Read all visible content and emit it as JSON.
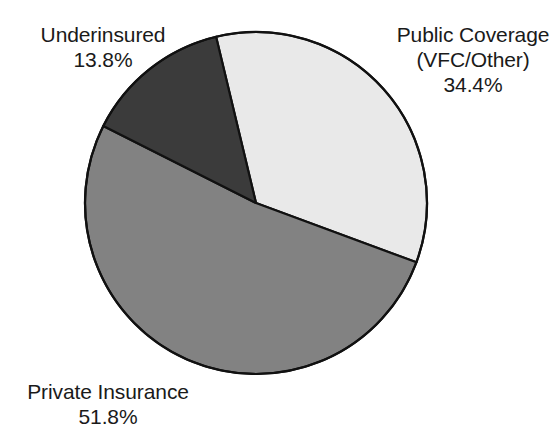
{
  "chart_data": {
    "type": "pie",
    "title": "",
    "categories": [
      "Public Coverage (VFC/Other)",
      "Private Insurance",
      "Underinsured"
    ],
    "values": [
      34.4,
      51.8,
      13.8
    ],
    "value_suffix": "%",
    "legend": "none",
    "grid": false,
    "slices": [
      {
        "label": "Public Coverage",
        "label_line2": "(VFC/Other)",
        "percent_text": "34.4%",
        "value": 34.4,
        "color": "#e9e9e9",
        "start_angle_deg": -13.5,
        "end_angle_deg": 110.3
      },
      {
        "label": "Private Insurance",
        "label_line2": "",
        "percent_text": "51.8%",
        "value": 51.8,
        "color": "#828282",
        "start_angle_deg": 110.3,
        "end_angle_deg": 296.8
      },
      {
        "label": "Underinsured",
        "label_line2": "",
        "percent_text": "13.8%",
        "value": 13.8,
        "color": "#3b3b3b",
        "start_angle_deg": 296.8,
        "end_angle_deg": 346.5
      }
    ]
  },
  "labels": {
    "underinsured": {
      "name": "Underinsured",
      "percent": "13.8%"
    },
    "public_coverage": {
      "name": "Public Coverage",
      "subtitle": "(VFC/Other)",
      "percent": "34.4%"
    },
    "private_insurance": {
      "name": "Private Insurance",
      "percent": "51.8%"
    }
  },
  "style": {
    "background": "#ffffff",
    "outline": "#111111",
    "text_color": "#1a1a1a",
    "center_x": 256,
    "center_y": 203,
    "radius": 171
  }
}
